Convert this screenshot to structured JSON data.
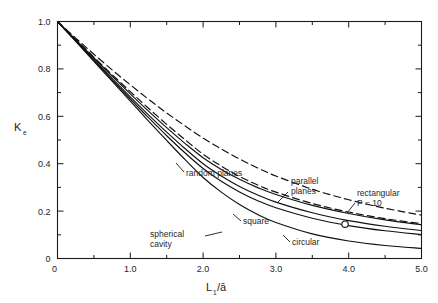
{
  "figure": {
    "background": "#ffffff",
    "ink_color": "#1a1a1a"
  },
  "axes": {
    "x": {
      "label_main": "L",
      "label_sub": "1",
      "label_rest": "/ā",
      "label_full": "L₁/ā",
      "min": 0,
      "max": 5.0,
      "ticks": [
        0,
        1.0,
        2.0,
        3.0,
        4.0,
        5.0
      ],
      "tick_labels": [
        "0",
        "1.0",
        "2.0",
        "3.0",
        "4.0",
        "5.0"
      ],
      "minor_step": 0.5
    },
    "y": {
      "label_main": "K",
      "label_sub": "e",
      "label_full": "Kₑ",
      "min": 0,
      "max": 1.0,
      "ticks": [
        0,
        0.2,
        0.4,
        0.6,
        0.8,
        1.0
      ],
      "tick_labels": [
        "0",
        "0.2",
        "0.4",
        "0.6",
        "0.8",
        "1.0"
      ],
      "minor_step": 0.1
    }
  },
  "annotations": [
    {
      "id": "random-planes",
      "text": "random planes",
      "x": 186,
      "y": 176,
      "leader": true
    },
    {
      "id": "parallel-planes",
      "text_line1": "parallel",
      "text_line2": "planes",
      "x": 291,
      "y": 184,
      "leader": true
    },
    {
      "id": "rectangular",
      "text_line1": "rectangular",
      "text_line2": "P = 10",
      "x": 357,
      "y": 196,
      "leader": true
    },
    {
      "id": "square",
      "text": "square",
      "x": 243,
      "y": 224,
      "leader": true
    },
    {
      "id": "circular",
      "text": "circular",
      "x": 292,
      "y": 245,
      "leader": true
    },
    {
      "id": "spherical-cavity",
      "text_line1": "spherical",
      "text_line2": "cavity",
      "x": 168,
      "y": 237,
      "leader": true
    }
  ],
  "markers": [
    {
      "id": "rectangular-point",
      "x": 3.95,
      "y": 0.145,
      "shape": "circle-open"
    }
  ],
  "chart_data": {
    "type": "line",
    "title": "",
    "xlabel": "L₁/ā",
    "ylabel": "Kₑ",
    "xlim": [
      0,
      5.0
    ],
    "ylim": [
      0,
      1.0
    ],
    "grid": false,
    "legend": "inline-annotations",
    "x": [
      0,
      0.25,
      0.5,
      0.75,
      1.0,
      1.25,
      1.5,
      1.75,
      2.0,
      2.25,
      2.5,
      2.75,
      3.0,
      3.5,
      4.0,
      4.5,
      5.0
    ],
    "series": [
      {
        "name": "random planes",
        "style": "dashed",
        "values": [
          1.0,
          0.93,
          0.862,
          0.796,
          0.733,
          0.672,
          0.614,
          0.56,
          0.508,
          0.462,
          0.42,
          0.382,
          0.348,
          0.292,
          0.248,
          0.212,
          0.183
        ]
      },
      {
        "name": "parallel planes",
        "style": "dashed",
        "values": [
          1.0,
          0.925,
          0.85,
          0.776,
          0.704,
          0.634,
          0.566,
          0.502,
          0.44,
          0.39,
          0.346,
          0.31,
          0.28,
          0.232,
          0.196,
          0.168,
          0.147
        ]
      },
      {
        "name": "rectangular P = 10",
        "style": "solid",
        "values": [
          1.0,
          0.923,
          0.846,
          0.77,
          0.695,
          0.622,
          0.552,
          0.486,
          0.425,
          0.376,
          0.334,
          0.299,
          0.27,
          0.224,
          0.19,
          0.163,
          0.142
        ]
      },
      {
        "name": "square",
        "style": "solid",
        "values": [
          1.0,
          0.92,
          0.84,
          0.76,
          0.682,
          0.606,
          0.533,
          0.464,
          0.4,
          0.348,
          0.304,
          0.268,
          0.238,
          0.193,
          0.16,
          0.136,
          0.118
        ]
      },
      {
        "name": "circular",
        "style": "solid",
        "values": [
          1.0,
          0.918,
          0.836,
          0.754,
          0.673,
          0.594,
          0.518,
          0.446,
          0.38,
          0.326,
          0.281,
          0.244,
          0.214,
          0.17,
          0.139,
          0.117,
          0.101
        ]
      },
      {
        "name": "spherical cavity",
        "style": "solid",
        "values": [
          1.0,
          0.916,
          0.832,
          0.748,
          0.664,
          0.58,
          0.498,
          0.418,
          0.342,
          0.28,
          0.228,
          0.186,
          0.152,
          0.104,
          0.074,
          0.055,
          0.043
        ]
      }
    ],
    "markers": [
      {
        "series": "rectangular P = 10",
        "x": 3.95,
        "y": 0.145
      }
    ]
  }
}
